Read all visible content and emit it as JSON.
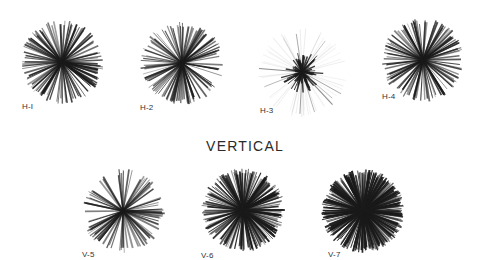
{
  "section_title": "VERTICAL",
  "ink_color": "#1a1a1a",
  "background": "#ffffff",
  "roses": [
    {
      "id": "h1",
      "label": "H-I",
      "cx": 62,
      "cy": 62,
      "r": 42,
      "rays": 120,
      "density": 0.55,
      "core": 0,
      "faint": false,
      "label_x": 22,
      "label_y": 102,
      "seed": 11
    },
    {
      "id": "h2",
      "label": "H-2",
      "cx": 182,
      "cy": 63,
      "r": 42,
      "rays": 110,
      "density": 0.45,
      "core": 0,
      "faint": false,
      "label_x": 140,
      "label_y": 103,
      "seed": 23
    },
    {
      "id": "h3",
      "label": "H-3",
      "cx": 302,
      "cy": 72,
      "r": 45,
      "rays": 60,
      "density": 0.12,
      "core": 14,
      "faint": true,
      "label_x": 260,
      "label_y": 106,
      "seed": 37
    },
    {
      "id": "h4",
      "label": "H-4",
      "cx": 423,
      "cy": 60,
      "r": 42,
      "rays": 120,
      "density": 0.45,
      "core": 0,
      "faint": false,
      "label_x": 382,
      "label_y": 92,
      "seed": 41
    },
    {
      "id": "v5",
      "label": "V-5",
      "cx": 123,
      "cy": 211,
      "r": 42,
      "rays": 90,
      "density": 0.4,
      "core": 0,
      "faint": false,
      "label_x": 82,
      "label_y": 250,
      "seed": 53
    },
    {
      "id": "v6",
      "label": "V-6",
      "cx": 243,
      "cy": 210,
      "r": 42,
      "rays": 200,
      "density": 0.6,
      "core": 0,
      "faint": false,
      "label_x": 201,
      "label_y": 251,
      "seed": 67
    },
    {
      "id": "v7",
      "label": "V-7",
      "cx": 363,
      "cy": 211,
      "r": 42,
      "rays": 300,
      "density": 0.75,
      "core": 0,
      "faint": false,
      "label_x": 328,
      "label_y": 250,
      "seed": 79
    }
  ]
}
